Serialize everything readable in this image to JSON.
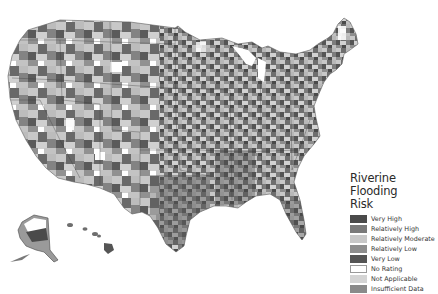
{
  "map": {
    "title": "Riverine Flooding Risk",
    "regions_shown": [
      "Contiguous United States",
      "Alaska",
      "Hawaii"
    ],
    "color_scheme": "grayscale"
  },
  "legend": {
    "title_line1": "Riverine Flooding",
    "title_line2": "Risk",
    "items": [
      {
        "label": "Very High",
        "color": "#4a4a4a",
        "border": "#4a4a4a"
      },
      {
        "label": "Relatively High",
        "color": "#7a7a7a",
        "border": "#7a7a7a"
      },
      {
        "label": "Relatively Moderate",
        "color": "#c8c8c8",
        "border": "#c8c8c8"
      },
      {
        "label": "Relatively Low",
        "color": "#8e8e8e",
        "border": "#8e8e8e"
      },
      {
        "label": "Very Low",
        "color": "#555555",
        "border": "#555555"
      },
      {
        "label": "No Rating",
        "color": "#ffffff",
        "border": "#9a9a9a"
      },
      {
        "label": "Not Applicable",
        "color": "#d4d4d4",
        "border": "#d4d4d4"
      },
      {
        "label": "Insufficient Data",
        "color": "#8a8a8a",
        "border": "#8a8a8a"
      }
    ]
  }
}
